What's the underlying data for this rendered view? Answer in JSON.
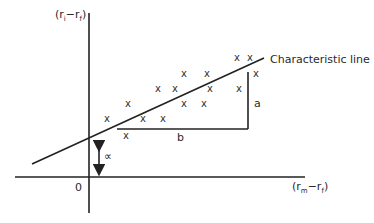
{
  "diagram": {
    "y_axis": {
      "label_open": "(r",
      "label_sub1": "i",
      "label_minus": "−r",
      "label_sub2": "f",
      "label_close": ")"
    },
    "x_axis": {
      "label_open": "(r",
      "label_sub1": "m",
      "label_minus": "−r",
      "label_sub2": "f",
      "label_close": ")"
    },
    "origin_label": "0",
    "line_label": "Characteristic line",
    "rise_label": "a",
    "run_label": "b",
    "intercept_label": "∝",
    "mark_glyph": "x",
    "points": [
      {
        "x": 237,
        "y": 58
      },
      {
        "x": 250,
        "y": 58
      },
      {
        "x": 184,
        "y": 74
      },
      {
        "x": 207,
        "y": 74
      },
      {
        "x": 256,
        "y": 74
      },
      {
        "x": 158,
        "y": 89
      },
      {
        "x": 175,
        "y": 89
      },
      {
        "x": 210,
        "y": 89
      },
      {
        "x": 239,
        "y": 89
      },
      {
        "x": 128,
        "y": 104
      },
      {
        "x": 184,
        "y": 104
      },
      {
        "x": 204,
        "y": 104
      },
      {
        "x": 107,
        "y": 119
      },
      {
        "x": 143,
        "y": 119
      },
      {
        "x": 163,
        "y": 119
      },
      {
        "x": 126,
        "y": 136
      }
    ],
    "colors": {
      "line": "#222222",
      "text": "#2a2a2a",
      "background": "#ffffff"
    }
  }
}
